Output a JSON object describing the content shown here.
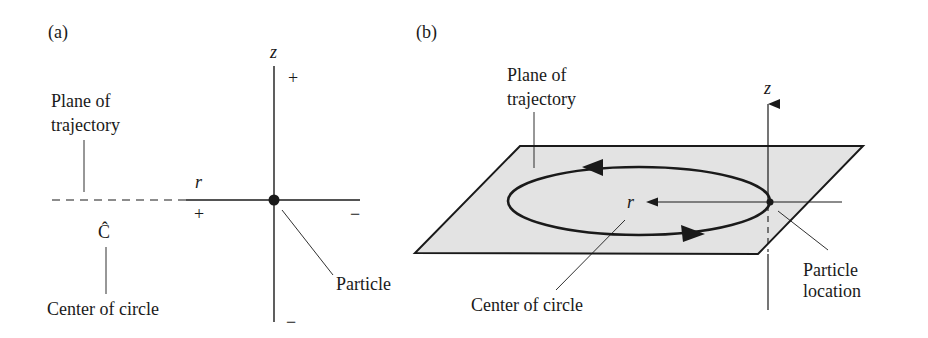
{
  "panel_a": {
    "label": "(a)",
    "z_axis_label": "z",
    "r_axis_label": "r",
    "z_plus": "+",
    "z_minus": "−",
    "r_plus": "+",
    "r_minus": "−",
    "plane_label_line1": "Plane of",
    "plane_label_line2": "trajectory",
    "center_symbol": "Ĉ",
    "center_label": "Center of circle",
    "particle_label": "Particle"
  },
  "panel_b": {
    "label": "(b)",
    "z_axis_label": "z",
    "r_label": "r",
    "plane_label_line1": "Plane of",
    "plane_label_line2": "trajectory",
    "center_label": "Center of circle",
    "particle_label_line1": "Particle",
    "particle_label_line2": "location"
  },
  "colors": {
    "ink": "#1a1a1a",
    "plane_fill": "#e3e3e3",
    "background": "#ffffff"
  }
}
